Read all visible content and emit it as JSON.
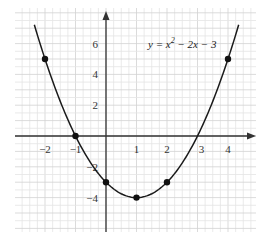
{
  "chart_data": {
    "type": "line",
    "title": "",
    "equation": "y = x² − 2x − 3",
    "equation_parts": {
      "lhs": "y = x",
      "exp": "2",
      "rhs": " − 2x − 3"
    },
    "xlabel": "",
    "ylabel": "",
    "xlim": [
      -3,
      5
    ],
    "ylim": [
      -6.2,
      8
    ],
    "grid": true,
    "x_ticks": [
      -2,
      -1,
      1,
      2,
      3,
      4
    ],
    "x_tick_labels": [
      "−2",
      "−1",
      "1",
      "2",
      "3",
      "4"
    ],
    "y_ticks": [
      6,
      4,
      2,
      -2,
      -4
    ],
    "y_tick_labels": [
      "6",
      "4",
      "2",
      "−2",
      "−4"
    ],
    "curve": {
      "a": 1,
      "b": -2,
      "c": -3,
      "x_from": -2.35,
      "x_to": 4.35
    },
    "points": [
      {
        "x": -2,
        "y": 5
      },
      {
        "x": -1,
        "y": 0
      },
      {
        "x": 0,
        "y": -3
      },
      {
        "x": 1,
        "y": -4
      },
      {
        "x": 2,
        "y": -3
      },
      {
        "x": 4,
        "y": 5
      }
    ],
    "roots": [
      -1,
      3
    ],
    "vertex": {
      "x": 1,
      "y": -4
    }
  },
  "colors": {
    "grid_minor": "#e4e4e4",
    "grid_major": "#d2d2d2",
    "axis": "#333333",
    "curve": "#1a1a1a",
    "point": "#111111"
  }
}
